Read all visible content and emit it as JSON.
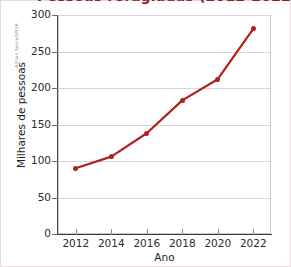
{
  "figure": {
    "title": "Pessoas refugiadas (2012-2022)",
    "credit": "Allison Sacco/UNEA",
    "accent_color": "#b0211f",
    "grid_color": "#d5d5da",
    "axis_color": "#3a3a3a",
    "title_color": "#8f1d20"
  },
  "chart_data": {
    "type": "line",
    "title": "Pessoas refugiadas (2012-2022)",
    "xlabel": "Ano",
    "ylabel": "Milhares de pessoas",
    "x": [
      2012,
      2014,
      2016,
      2018,
      2020,
      2022
    ],
    "values": [
      90,
      106,
      138,
      183,
      212,
      281
    ],
    "series": [
      {
        "name": "Milhares de pessoas",
        "color": "#b0211f",
        "values": [
          90,
          106,
          138,
          183,
          212,
          281
        ]
      }
    ],
    "xlim": [
      2011,
      2023
    ],
    "ylim": [
      0,
      300
    ],
    "ytick_labels": [
      "0",
      "50",
      "100",
      "150",
      "200",
      "250",
      "300"
    ],
    "ytick_values": [
      0,
      50,
      100,
      150,
      200,
      250,
      300
    ],
    "xtick_labels": [
      "2012",
      "2014",
      "2016",
      "2018",
      "2020",
      "2022"
    ],
    "xtick_values": [
      2012,
      2014,
      2016,
      2018,
      2020,
      2022
    ],
    "grid": "horizontal",
    "legend": "none",
    "markers": "filled-circle"
  }
}
